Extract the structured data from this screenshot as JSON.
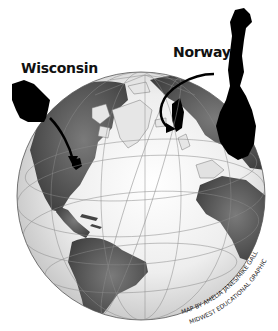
{
  "map": {
    "title": "Wisconsin and Norway locator globe",
    "labels": {
      "wisconsin": "Wisconsin",
      "norway": "Norway"
    },
    "credit": {
      "line1": "MAP BY AMELIA JANES/MIKE GALLAGHER,",
      "line2": "MIDWEST EDUCATIONAL GRAPHICS"
    },
    "colors": {
      "background": "#ffffff",
      "ocean_light": "#f4f4f4",
      "ocean_edge": "#cfcfcf",
      "land": "#5a5a5a",
      "highlight": "#000000",
      "arctic_land": "#e6e6e6",
      "graticule": "#8a8a8a"
    },
    "callouts": [
      {
        "name": "Wisconsin",
        "from": "inset silhouette left",
        "to": "Upper Midwest, North America"
      },
      {
        "name": "Norway",
        "from": "inset silhouette right",
        "to": "Scandinavia, Europe"
      }
    ]
  }
}
